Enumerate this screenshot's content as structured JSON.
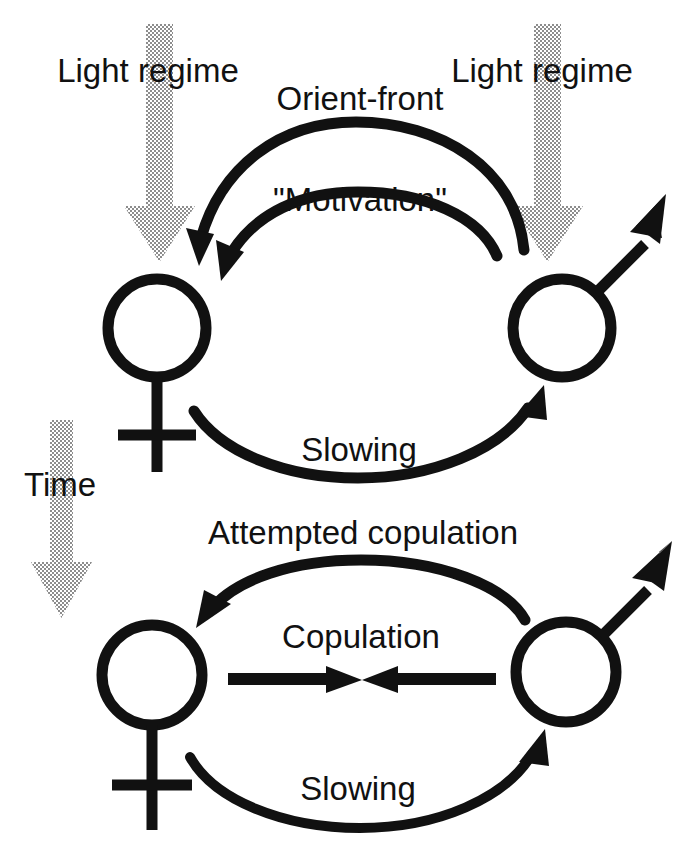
{
  "figure": {
    "kind": "behavioural-sequence-diagram",
    "background_color": "#ffffff",
    "ink_color": "#111111",
    "stipple_color": "#9a9a9a"
  },
  "labels": {
    "light_regime_left": "Light regime",
    "light_regime_right": "Light regime",
    "time": "Time",
    "orient_front": "Orient-front",
    "motivation": "\"Motivation\"",
    "slowing_top": "Slowing",
    "attempted_copulation": "Attempted copulation",
    "copulation": "Copulation",
    "slowing_bottom": "Slowing"
  },
  "symbols": {
    "female_top": "female-symbol",
    "male_top": "male-symbol",
    "female_bottom": "female-symbol",
    "male_bottom": "male-symbol"
  },
  "arrows": {
    "light_regime_left": {
      "icon": "stippled-down-arrow",
      "direction": "down",
      "style": "halftone"
    },
    "light_regime_right": {
      "icon": "stippled-down-arrow",
      "direction": "down",
      "style": "halftone"
    },
    "time": {
      "icon": "stippled-down-arrow",
      "direction": "down",
      "style": "halftone"
    },
    "orient_front": {
      "icon": "curved-arrow",
      "from": "male-symbol",
      "to": "female-symbol",
      "direction": "right-to-left"
    },
    "motivation": {
      "icon": "curved-arrow",
      "from": "male-symbol",
      "to": "female-symbol",
      "direction": "right-to-left"
    },
    "slowing_top": {
      "icon": "curved-arrow",
      "from": "female-symbol",
      "to": "male-symbol",
      "direction": "left-to-right"
    },
    "attempted_copulation": {
      "icon": "curved-arrow",
      "from": "male-symbol",
      "to": "female-symbol",
      "direction": "right-to-left"
    },
    "copulation_left": {
      "icon": "straight-arrow",
      "direction": "left-to-right"
    },
    "copulation_right": {
      "icon": "straight-arrow",
      "direction": "right-to-left"
    },
    "slowing_bottom": {
      "icon": "curved-arrow",
      "from": "female-symbol",
      "to": "male-symbol",
      "direction": "left-to-right"
    }
  }
}
